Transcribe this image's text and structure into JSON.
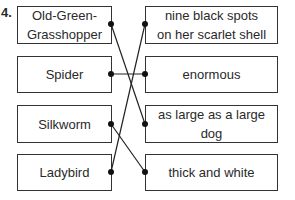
{
  "question_number": "4.",
  "left": [
    {
      "label": "Old-Green-Grasshopper",
      "lines": [
        "Old-Green-",
        "Grasshopper"
      ]
    },
    {
      "label": "Spider"
    },
    {
      "label": "Silkworm"
    },
    {
      "label": "Ladybird"
    }
  ],
  "right": [
    {
      "lines": [
        "nine black spots",
        "on her scarlet shell"
      ]
    },
    {
      "label": "enormous"
    },
    {
      "lines": [
        "as large as a large",
        "dog"
      ]
    },
    {
      "label": "thick and white"
    }
  ],
  "matches": [
    [
      "Old-Green-Grasshopper",
      "as large as a large dog"
    ],
    [
      "Spider",
      "enormous"
    ],
    [
      "Silkworm",
      "thick and white"
    ],
    [
      "Ladybird",
      "nine black spots on her scarlet shell"
    ]
  ]
}
